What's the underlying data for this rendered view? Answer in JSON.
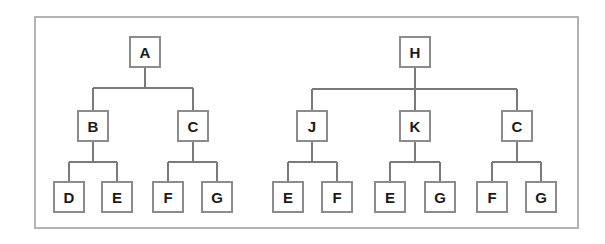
{
  "figure": {
    "kind": "tree-diagram",
    "background_color": "#ffffff",
    "frame": {
      "name": "outer-border",
      "x": 35,
      "y": 17,
      "width": 543,
      "height": 211,
      "stroke_color": "#b3b3b3",
      "stroke_width": 1.6,
      "fill": "none"
    },
    "style": {
      "node_stroke_color": "#8c8c8c",
      "node_stroke_width": 1.2,
      "node_fill": "#ffffff",
      "edge_color": "#7a7a7a",
      "edge_width": 1.3,
      "label_color": "#1a1a1a",
      "label_font_size": 15,
      "node_width": 30,
      "node_height": 30
    }
  },
  "trees": [
    {
      "name": "left-tree",
      "root": "A",
      "nodes": [
        {
          "id": "n-a",
          "label": "A",
          "cx": 145,
          "cy": 52,
          "level": 0
        },
        {
          "id": "n-b",
          "label": "B",
          "cx": 93,
          "cy": 126,
          "level": 1
        },
        {
          "id": "n-c",
          "label": "C",
          "cx": 193,
          "cy": 126,
          "level": 1
        },
        {
          "id": "n-d",
          "label": "D",
          "cx": 69,
          "cy": 197,
          "level": 2
        },
        {
          "id": "n-e1",
          "label": "E",
          "cx": 117,
          "cy": 197,
          "level": 2
        },
        {
          "id": "n-f1",
          "label": "F",
          "cx": 168,
          "cy": 197,
          "level": 2
        },
        {
          "id": "n-g1",
          "label": "G",
          "cx": 217,
          "cy": 197,
          "level": 2
        }
      ],
      "edges": [
        {
          "parent": "n-a",
          "children": [
            "n-b",
            "n-c"
          ],
          "bus_y": 88
        },
        {
          "parent": "n-b",
          "children": [
            "n-d",
            "n-e1"
          ],
          "bus_y": 162
        },
        {
          "parent": "n-c",
          "children": [
            "n-f1",
            "n-g1"
          ],
          "bus_y": 162
        }
      ]
    },
    {
      "name": "right-tree",
      "root": "H",
      "nodes": [
        {
          "id": "n-h",
          "label": "H",
          "cx": 415,
          "cy": 52,
          "level": 0
        },
        {
          "id": "n-j",
          "label": "J",
          "cx": 312,
          "cy": 126,
          "level": 1
        },
        {
          "id": "n-k",
          "label": "K",
          "cx": 415,
          "cy": 126,
          "level": 1
        },
        {
          "id": "n-c2",
          "label": "C",
          "cx": 517,
          "cy": 126,
          "level": 1
        },
        {
          "id": "n-e2",
          "label": "E",
          "cx": 288,
          "cy": 197,
          "level": 2
        },
        {
          "id": "n-f2",
          "label": "F",
          "cx": 337,
          "cy": 197,
          "level": 2
        },
        {
          "id": "n-e3",
          "label": "E",
          "cx": 390,
          "cy": 197,
          "level": 2
        },
        {
          "id": "n-g2",
          "label": "G",
          "cx": 440,
          "cy": 197,
          "level": 2
        },
        {
          "id": "n-f3",
          "label": "F",
          "cx": 492,
          "cy": 197,
          "level": 2
        },
        {
          "id": "n-g3",
          "label": "G",
          "cx": 541,
          "cy": 197,
          "level": 2
        }
      ],
      "edges": [
        {
          "parent": "n-h",
          "children": [
            "n-j",
            "n-k",
            "n-c2"
          ],
          "bus_y": 89
        },
        {
          "parent": "n-j",
          "children": [
            "n-e2",
            "n-f2"
          ],
          "bus_y": 162
        },
        {
          "parent": "n-k",
          "children": [
            "n-e3",
            "n-g2"
          ],
          "bus_y": 162
        },
        {
          "parent": "n-c2",
          "children": [
            "n-f3",
            "n-g3"
          ],
          "bus_y": 162
        }
      ]
    }
  ]
}
